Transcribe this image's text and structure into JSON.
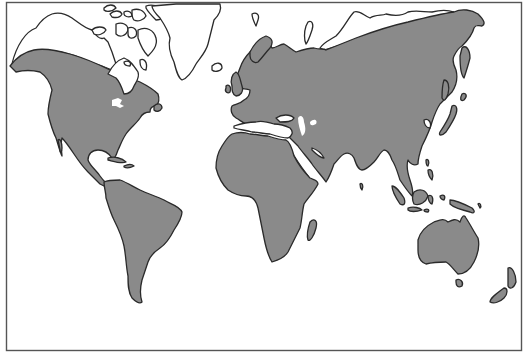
{
  "map": {
    "type": "world-distribution-map",
    "projection": "world outline, Pacific cut at Bering Strait",
    "colors": {
      "background": "#ffffff",
      "range_fill": "#8a8a8a",
      "outline": "#2a2a2a",
      "frame": "#555555"
    },
    "legend": {
      "shaded": "range (gray)",
      "unshaded": "outside range (white)"
    },
    "regions_shaded": [
      "North America (south of subarctic line)",
      "Central America & Caribbean",
      "South America",
      "Europe",
      "Africa",
      "Madagascar",
      "Asia (south of Siberian arctic line)",
      "Japan",
      "Southeast Asia & Indonesia",
      "New Guinea",
      "Australia",
      "Tasmania",
      "New Zealand"
    ],
    "regions_unshaded": [
      "Alaska / northern Canada",
      "Canadian Arctic Archipelago",
      "Greenland",
      "Iceland",
      "Svalbard",
      "Novaya Zemlya",
      "Northern Siberia",
      "Great Lakes",
      "Caspian Sea",
      "Aral Sea"
    ]
  }
}
